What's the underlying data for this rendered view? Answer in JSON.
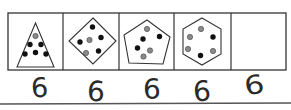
{
  "puzzle": {
    "cells": [
      {
        "shape": "triangle",
        "dots_black": 5,
        "dots_gray": 1,
        "total": 6
      },
      {
        "shape": "diamond",
        "dots_black": 4,
        "dots_gray": 2,
        "total": 6
      },
      {
        "shape": "pentagon",
        "dots_black": 3,
        "dots_gray": 3,
        "total": 6
      },
      {
        "shape": "hexagon",
        "dots_black": 2,
        "dots_gray": 4,
        "total": 6
      },
      {
        "shape": "empty",
        "dots_black": null,
        "dots_gray": null,
        "total": null
      }
    ],
    "answers": [
      "6",
      "6",
      "6",
      "6",
      "6"
    ]
  },
  "colors": {
    "line": "#333333",
    "black_dot": "#111111",
    "gray_dot": "#8a8a8a",
    "ink": "#2a2a2a",
    "rule": "#555555"
  }
}
